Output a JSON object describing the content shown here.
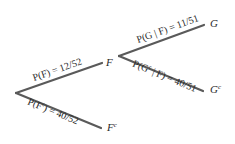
{
  "diagram": {
    "type": "probability-tree",
    "nodes": {
      "F": "F",
      "Fc_base": "F",
      "Fc_sup": "c",
      "G": "G",
      "Gc_base": "G",
      "Gc_sup": "c"
    },
    "edges": {
      "F": {
        "label": "P(F) = 12/52",
        "prefix": "P(F) = ",
        "value": "12/52"
      },
      "Fc": {
        "label_pre": "P(F",
        "label_sup": "c",
        "label_post": ") = 40/52",
        "value": "40/52"
      },
      "G_given_F": {
        "label": "P(G | F) = 11/51",
        "value": "11/51"
      },
      "Gc_given_F": {
        "label_pre": "P(G",
        "label_sup": "c",
        "label_post": " | F) = 40/51",
        "value": "40/51"
      }
    },
    "colors": {
      "line": "#5a5a5a",
      "text": "#2a2a2a",
      "background": "#ffffff"
    }
  }
}
